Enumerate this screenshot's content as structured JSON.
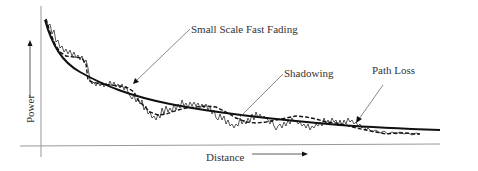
{
  "diagram": {
    "labels": {
      "small_scale": "Small Scale Fast Fading",
      "shadowing": "Shadowing",
      "path_loss": "Path Loss",
      "x_axis": "Distance",
      "y_axis": "Power"
    },
    "colors": {
      "curve": "#111111",
      "axis": "#888888",
      "text": "#333333"
    },
    "legend": [
      {
        "name": "Path Loss",
        "style": "solid thick"
      },
      {
        "name": "Shadowing",
        "style": "dashed"
      },
      {
        "name": "Small Scale Fast Fading",
        "style": "thin oscillating"
      }
    ]
  }
}
